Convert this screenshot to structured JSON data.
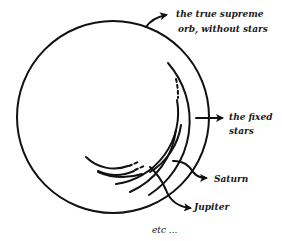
{
  "diagram": {
    "type": "celestial-spheres-sketch",
    "stroke_color": "#111111",
    "background": "#ffffff",
    "labels": {
      "supreme_orb_line1": "the true supreme",
      "supreme_orb_line2": "orb, without stars",
      "fixed_stars_line1": "the fixed",
      "fixed_stars_line2": "stars",
      "saturn": "Saturn",
      "jupiter": "Jupiter",
      "etc": "etc ..."
    }
  }
}
